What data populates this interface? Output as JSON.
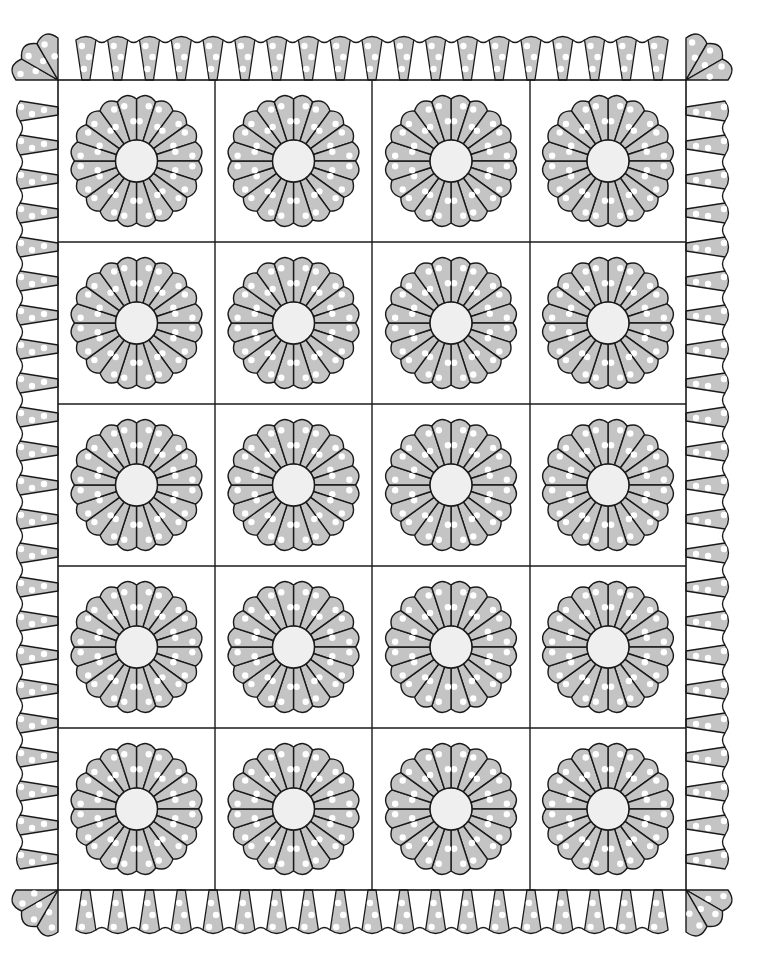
{
  "illustration": {
    "title": "Dresden Plate Quilt",
    "width": 765,
    "height": 965,
    "colors": {
      "background": "#ffffff",
      "stroke": "#1a1a1a",
      "petal_fill": "#c4c4c4",
      "dot_fill": "#ffffff",
      "center_fill": "#efefef"
    },
    "grid": {
      "x_lines": [
        58,
        215,
        372,
        530,
        686
      ],
      "y_lines": [
        80,
        242,
        404,
        566,
        728,
        890
      ],
      "columns": 4,
      "rows": 5
    },
    "plate": {
      "petal_count": 20,
      "outer_radius": 66,
      "center_radius": 21,
      "scallop_depth": 4,
      "dots_per_petal": 2
    },
    "border": {
      "outer_left": 15,
      "outer_right": 730,
      "outer_top": 35,
      "outer_bottom": 935,
      "top_wedge_count": 19,
      "bottom_wedge_count": 19,
      "side_wedge_count": 23,
      "corner_petals": 3
    }
  }
}
